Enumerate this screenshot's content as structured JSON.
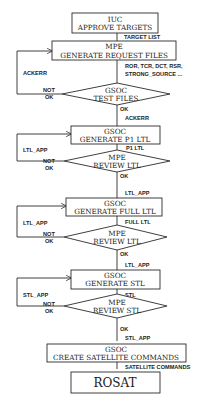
{
  "diagram": {
    "type": "flowchart",
    "colors": {
      "line": "#2a2a2a",
      "background": "#ffffff",
      "text": "#1a1a1a"
    },
    "nodes": [
      {
        "id": "n1",
        "shape": "box",
        "actor": "IUC",
        "label": "APPROVE TARGETS"
      },
      {
        "id": "n2",
        "shape": "box",
        "actor": "MPE",
        "label": "GENERATE REQUEST FILES"
      },
      {
        "id": "n3",
        "shape": "diamond",
        "actor": "GSOC",
        "label": "TEST FILES"
      },
      {
        "id": "n4",
        "shape": "box",
        "actor": "GSOC",
        "label": "GENERATE P1 LTL"
      },
      {
        "id": "n5",
        "shape": "diamond",
        "actor": "MPE",
        "label": "REVIEW LTL"
      },
      {
        "id": "n6",
        "shape": "box",
        "actor": "GSOC",
        "label": "GENERATE FULL LTL"
      },
      {
        "id": "n7",
        "shape": "diamond",
        "actor": "MPE",
        "label": "REVIEW LTL"
      },
      {
        "id": "n8",
        "shape": "box",
        "actor": "GSOC",
        "label": "GENERATE STL"
      },
      {
        "id": "n9",
        "shape": "diamond",
        "actor": "MPE",
        "label": "REVIEW STL"
      },
      {
        "id": "n10",
        "shape": "box",
        "actor": "GSOC",
        "label": "CREATE SATELLITE COMMANDS"
      },
      {
        "id": "n11",
        "shape": "box",
        "actor": "",
        "label": "ROSAT"
      }
    ],
    "edges": [
      {
        "from": "n1",
        "to": "n2",
        "label": "TARGET LIST"
      },
      {
        "from": "n2",
        "to": "n3",
        "label_line1": "ROR, TCR, DCT, RSR,",
        "label_line2": "STRONG_SOURCE ..."
      },
      {
        "from": "n3",
        "to": "n2",
        "label": "ACKERR",
        "condition": {
          "line1": "NOT",
          "line2": "OK"
        }
      },
      {
        "from": "n3",
        "to": "n4",
        "label": "ACKERR",
        "condition": "OK"
      },
      {
        "from": "n4",
        "to": "n5",
        "label": "P1 LTL"
      },
      {
        "from": "n5",
        "to": "n4",
        "label": "LTL_APP",
        "condition": {
          "line1": "NOT",
          "line2": "OK"
        }
      },
      {
        "from": "n5",
        "to": "n6",
        "label": "LTL_APP",
        "condition": "OK"
      },
      {
        "from": "n6",
        "to": "n7",
        "label": "FULL LTL"
      },
      {
        "from": "n7",
        "to": "n6",
        "label": "LTL_APP",
        "condition": {
          "line1": "NOT",
          "line2": "OK"
        }
      },
      {
        "from": "n7",
        "to": "n8",
        "label": "LTL_APP",
        "condition": "OK"
      },
      {
        "from": "n8",
        "to": "n9",
        "label": "STL"
      },
      {
        "from": "n9",
        "to": "n8",
        "label": "STL_APP",
        "condition": {
          "line1": "NOT",
          "line2": "OK"
        }
      },
      {
        "from": "n9",
        "to": "n10",
        "label": "STL_APP",
        "condition": "OK"
      },
      {
        "from": "n10",
        "to": "n11",
        "label": "SATELLITE COMMANDS"
      }
    ]
  }
}
